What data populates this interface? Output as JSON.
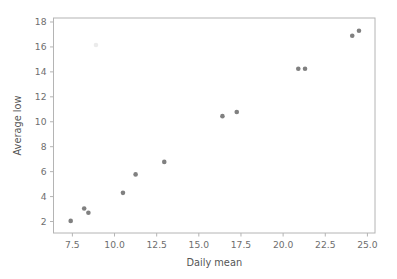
{
  "figure": {
    "background_color": "#ffffff",
    "spine_color": "#b4b4b4",
    "tick_label_color": "#6e6e6e",
    "axis_label_color": "#555555"
  },
  "chart_data": {
    "type": "scatter",
    "title": "",
    "xlabel": "Daily mean",
    "ylabel": "Average low",
    "xlim": [
      6.38,
      25.45
    ],
    "ylim": [
      1.08,
      18.32
    ],
    "xticks": [
      7.5,
      10.0,
      12.5,
      15.0,
      17.5,
      20.0,
      22.5,
      25.0
    ],
    "xtick_labels": [
      "7.5",
      "10.0",
      "12.5",
      "15.0",
      "17.5",
      "20.0",
      "22.5",
      "25.0"
    ],
    "yticks": [
      2,
      4,
      6,
      8,
      10,
      12,
      14,
      16,
      18
    ],
    "ytick_labels": [
      "2",
      "4",
      "6",
      "8",
      "10",
      "12",
      "14",
      "16",
      "18"
    ],
    "grid": false,
    "legend": null,
    "marker": "circle",
    "marker_size": 4.6,
    "marker_color": "#808080",
    "series": [
      {
        "name": "stations",
        "points": [
          {
            "x": 7.4,
            "y": 2.05,
            "opacity": 1.0
          },
          {
            "x": 8.2,
            "y": 3.05,
            "opacity": 1.0
          },
          {
            "x": 8.45,
            "y": 2.7,
            "opacity": 1.0
          },
          {
            "x": 8.9,
            "y": 16.15,
            "opacity": 0.16
          },
          {
            "x": 10.5,
            "y": 4.3,
            "opacity": 1.0
          },
          {
            "x": 11.25,
            "y": 5.78,
            "opacity": 1.0
          },
          {
            "x": 12.95,
            "y": 6.78,
            "opacity": 1.0
          },
          {
            "x": 16.4,
            "y": 10.45,
            "opacity": 1.0
          },
          {
            "x": 17.25,
            "y": 10.78,
            "opacity": 1.0
          },
          {
            "x": 20.9,
            "y": 14.25,
            "opacity": 1.0
          },
          {
            "x": 21.3,
            "y": 14.25,
            "opacity": 1.0
          },
          {
            "x": 24.1,
            "y": 16.9,
            "opacity": 1.0
          },
          {
            "x": 24.5,
            "y": 17.3,
            "opacity": 1.0
          }
        ]
      }
    ]
  }
}
